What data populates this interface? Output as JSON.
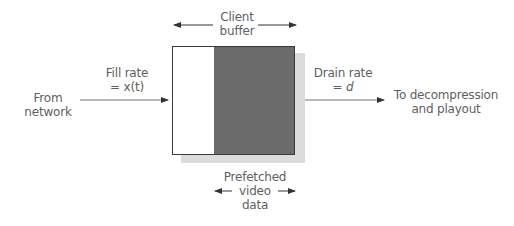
{
  "diagram": {
    "buffer_label": [
      "Client",
      "buffer"
    ],
    "source_label": [
      "From",
      "network"
    ],
    "fill_rate_label": [
      "Fill rate",
      "= x(t)"
    ],
    "drain_rate_label": [
      "Drain rate",
      "= d"
    ],
    "sink_label": [
      "To decompression",
      "and playout"
    ],
    "prefetched_label": [
      "Prefetched",
      "video",
      "data"
    ],
    "colors": {
      "buffer_fill": "#6b6b6b",
      "buffer_empty": "#ffffff",
      "shadow": "#dcdcdc",
      "arrow": "#555555",
      "text": "#5f5f5f"
    }
  }
}
